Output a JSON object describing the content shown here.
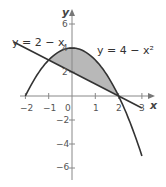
{
  "chart_data": {
    "type": "line",
    "title": "",
    "xlabel": "x",
    "ylabel": "y",
    "xlim": [
      -2.3,
      3.3
    ],
    "ylim": [
      -7,
      7
    ],
    "xticks": [
      -2,
      -1,
      0,
      1,
      2,
      3
    ],
    "yticks": [
      -6,
      -4,
      -2,
      2,
      4,
      6
    ],
    "grid": false,
    "series": [
      {
        "name": "y = 4 - x^2",
        "label": "y = 4 − x²",
        "expression": "4 - x^2",
        "domain": [
          -2,
          3
        ],
        "color": "#333333"
      },
      {
        "name": "y = 2 - x",
        "label": "y = 2 − x",
        "expression": "2 - x",
        "domain": [
          -2.5,
          3
        ],
        "color": "#333333"
      }
    ],
    "shaded_region": {
      "between": [
        "y = 4 - x^2",
        "y = 2 - x"
      ],
      "x_range": [
        -1,
        2
      ],
      "fill": "#b5b5b5"
    },
    "intersections": [
      [
        -1,
        3
      ],
      [
        2,
        0
      ]
    ],
    "annotations": [
      {
        "text": "y = 2 − x",
        "anchor": "upper-left"
      },
      {
        "text": "y = 4 − x²",
        "anchor": "upper-right"
      }
    ]
  },
  "labels": {
    "x_axis": "x",
    "y_axis": "y",
    "origin": "0",
    "eq_line": "y = 2 − x",
    "eq_parabola": "y = 4 − x²",
    "xtick": [
      "−2",
      "−1",
      "1",
      "2",
      "3"
    ],
    "ytick": [
      "6",
      "4",
      "2",
      "−2",
      "−4",
      "−6"
    ]
  }
}
